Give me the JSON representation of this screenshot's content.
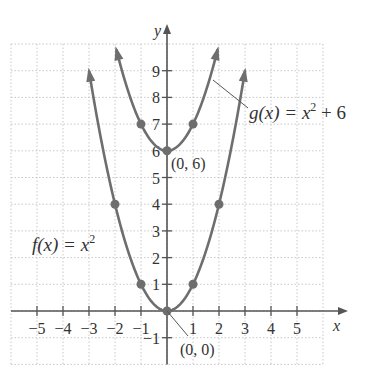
{
  "chart_data": {
    "type": "line",
    "title": "",
    "xlabel": "x",
    "ylabel": "y",
    "xlim": [
      -6,
      6
    ],
    "ylim": [
      -2,
      10
    ],
    "grid": true,
    "x_ticks": [
      "-5",
      "-4",
      "-3",
      "-2",
      "-1",
      "1",
      "2",
      "3",
      "4",
      "5"
    ],
    "y_ticks": [
      "-1",
      "1",
      "2",
      "3",
      "4",
      "5",
      "6",
      "7",
      "8",
      "9"
    ],
    "series": [
      {
        "name": "f(x) = x^2",
        "label_text": "f(x) = x",
        "label_sup": "2",
        "points": [
          [
            -2,
            4
          ],
          [
            -1,
            1
          ],
          [
            0,
            0
          ],
          [
            1,
            1
          ],
          [
            2,
            4
          ]
        ]
      },
      {
        "name": "g(x) = x^2 + 6",
        "label_text": "g(x) = x",
        "label_sup": "2",
        "label_tail": " + 6",
        "points": [
          [
            -1,
            7
          ],
          [
            0,
            6
          ],
          [
            1,
            7
          ]
        ]
      }
    ],
    "annotations": [
      {
        "text": "(0, 6)",
        "x": 0,
        "y": 6
      },
      {
        "text": "(0, 0)",
        "x": 0,
        "y": 0
      }
    ],
    "colors": {
      "curve": "#6e6e6e",
      "grid": "#c8c8c8",
      "axis": "#555555",
      "text": "#333333"
    }
  },
  "labels": {
    "x_axis": "x",
    "y_axis": "y",
    "f_label": "f(x) = x",
    "f_sup": "2",
    "g_label": "g(x) = x",
    "g_sup": "2",
    "g_tail": " + 6",
    "vertex_g": "(0, 6)",
    "vertex_f": "(0, 0)"
  }
}
